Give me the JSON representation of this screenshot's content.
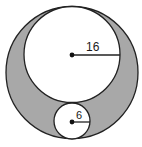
{
  "diagram": {
    "type": "geometry",
    "colors": {
      "shaded": "#a8a8a8",
      "stroke": "#222222",
      "inner_fill": "#ffffff"
    },
    "outer_circle": {
      "cx": 72,
      "cy": 72.5,
      "r": 66
    },
    "large_inner_circle": {
      "cx": 72,
      "cy": 54.5,
      "r": 48,
      "radius_label": "16"
    },
    "small_inner_circle": {
      "cx": 72,
      "cy": 121,
      "r": 18,
      "radius_label": "6"
    }
  }
}
